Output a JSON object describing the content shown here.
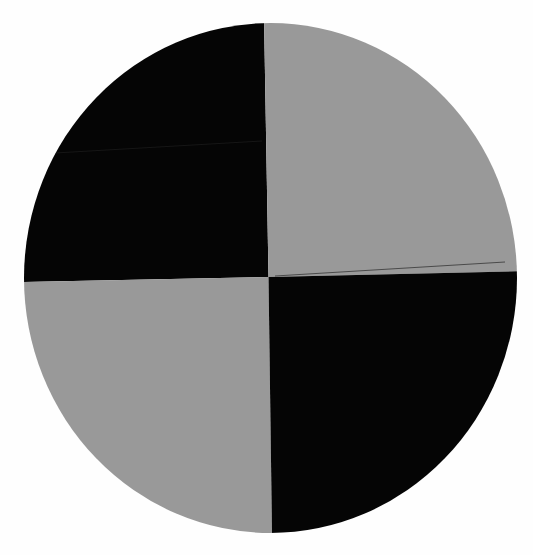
{
  "target": {
    "type": "quadrant-calibration-target",
    "shape": "circle",
    "colors": {
      "background": "#fefefe",
      "dark": "#050505",
      "light": "#999999"
    },
    "quadrants": [
      {
        "position": "top-left",
        "color": "dark"
      },
      {
        "position": "top-right",
        "color": "light"
      },
      {
        "position": "bottom-left",
        "color": "light"
      },
      {
        "position": "bottom-right",
        "color": "dark"
      }
    ]
  }
}
